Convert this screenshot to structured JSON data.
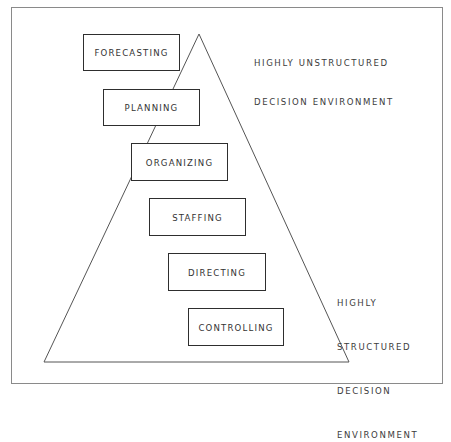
{
  "diagram": {
    "title": "",
    "shape": "triangle",
    "functions": [
      {
        "label": "FORECASTING"
      },
      {
        "label": "PLANNING"
      },
      {
        "label": "ORGANIZING"
      },
      {
        "label": "STAFFING"
      },
      {
        "label": "DIRECTING"
      },
      {
        "label": "CONTROLLING"
      }
    ],
    "annotations": {
      "top": {
        "line1": "HIGHLY UNSTRUCTURED",
        "line2": "DECISION ENVIRONMENT"
      },
      "bottom": {
        "line1": "HIGHLY",
        "line2": "STRUCTURED",
        "line3": "DECISION",
        "line4": "ENVIRONMENT"
      }
    },
    "colors": {
      "line": "#555555",
      "box_border": "#2e2e2e",
      "text": "#333333",
      "background": "#ffffff"
    }
  }
}
